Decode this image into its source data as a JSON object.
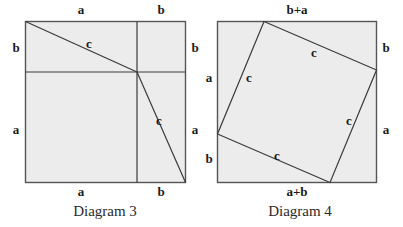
{
  "page": {
    "background": "#ffffff",
    "width": 403,
    "height": 227
  },
  "style": {
    "square_fill": "#ececec",
    "square_stroke": "#555555",
    "inner_line_stroke": "#3a3a3a",
    "label_color": "#1a1a1a",
    "caption_color": "#2b2b2b"
  },
  "diagrams": [
    {
      "id": "diagram-3",
      "caption": "Diagram 3",
      "square": {
        "x": 25,
        "y": 21,
        "width": 161,
        "height": 162
      },
      "split": {
        "x": 137,
        "y": 72
      },
      "labels": {
        "top_left": "a",
        "top_right": "b",
        "left_upper": "b",
        "left_lower": "a",
        "right_upper": "b",
        "right_lower": "a",
        "bottom_left": "a",
        "bottom_right": "b",
        "hyp_upper": "c",
        "hyp_lower": "c"
      }
    },
    {
      "id": "diagram-4",
      "caption": "Diagram 4",
      "square": {
        "x": 217,
        "y": 21,
        "width": 160,
        "height": 162
      },
      "inner_quad": [
        {
          "x": 264,
          "y": 21
        },
        {
          "x": 377,
          "y": 70
        },
        {
          "x": 330,
          "y": 183
        },
        {
          "x": 217,
          "y": 134
        }
      ],
      "labels": {
        "top": "b+a",
        "left_upper": "a",
        "left_lower": "b",
        "right_upper": "b",
        "right_lower": "a",
        "bottom": "a+b",
        "side_top": "c",
        "side_left": "c",
        "side_right": "c",
        "side_bottom": "c"
      }
    }
  ]
}
